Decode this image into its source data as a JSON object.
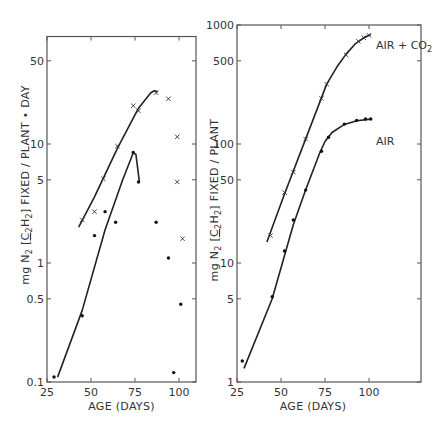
{
  "chart_data": [
    {
      "type": "scatter",
      "panel": "left",
      "title": "",
      "xlabel": "AGE (DAYS)",
      "ylabel": "mg N2 [C2H2] FIXED / PLANT • DAY",
      "yscale": "log",
      "xlim": [
        25,
        110
      ],
      "ylim": [
        0.1,
        80
      ],
      "xticks": [
        25,
        50,
        75,
        100
      ],
      "xtick_labels": [
        "25",
        "50",
        "75",
        "100"
      ],
      "yticks": [
        0.1,
        0.5,
        1,
        5,
        10,
        50
      ],
      "ytick_labels": [
        "0.1",
        "0.5",
        "1",
        "5",
        "10",
        "50"
      ],
      "grid": false,
      "series": [
        {
          "name": "AIR + CO2 (x)",
          "marker": "x",
          "points": [
            [
              45,
              2.3
            ],
            [
              52,
              2.7
            ],
            [
              57,
              5.1
            ],
            [
              65,
              9.6
            ],
            [
              74,
              21
            ],
            [
              77,
              19
            ],
            [
              87,
              27
            ],
            [
              94,
              24
            ],
            [
              99,
              11.5
            ],
            [
              99,
              4.8
            ],
            [
              102,
              1.6
            ]
          ],
          "fit_line": [
            [
              43,
              2.0
            ],
            [
              52,
              3.6
            ],
            [
              65,
              9.2
            ],
            [
              77,
              20
            ],
            [
              84,
              27
            ],
            [
              86,
              28
            ],
            [
              88,
              27.5
            ]
          ]
        },
        {
          "name": "AIR (filled)",
          "marker": "dot",
          "points": [
            [
              29,
              0.11
            ],
            [
              45,
              0.36
            ],
            [
              52,
              1.7
            ],
            [
              58,
              2.7
            ],
            [
              64,
              2.2
            ],
            [
              74,
              8.5
            ],
            [
              77,
              4.8
            ],
            [
              87,
              2.2
            ],
            [
              94,
              1.1
            ],
            [
              97,
              0.12
            ],
            [
              101,
              0.45
            ]
          ],
          "fit_line": [
            [
              31,
              0.11
            ],
            [
              45,
              0.4
            ],
            [
              58,
              1.9
            ],
            [
              68,
              5
            ],
            [
              74,
              8.4
            ],
            [
              75.5,
              8.2
            ],
            [
              77,
              5.5
            ],
            [
              77.5,
              4.8
            ]
          ]
        }
      ]
    },
    {
      "type": "line",
      "panel": "right",
      "title": "",
      "xlabel": "AGE (DAYS)",
      "ylabel": "mg N2 [C2H2] FIXED / PLANT",
      "yscale": "log",
      "xlim": [
        25,
        130
      ],
      "ylim": [
        1,
        1000
      ],
      "xticks": [
        25,
        50,
        75,
        100
      ],
      "xtick_labels": [
        "25",
        "50",
        "75",
        "100"
      ],
      "yticks": [
        1,
        5,
        10,
        50,
        100,
        500,
        1000
      ],
      "ytick_labels": [
        "1",
        "5",
        "10",
        "50",
        "100",
        "500",
        "1000"
      ],
      "grid": false,
      "series": [
        {
          "name": "AIR + CO2",
          "marker": "x",
          "points": [
            [
              44,
              17
            ],
            [
              52,
              39
            ],
            [
              57,
              58
            ],
            [
              64,
              110
            ],
            [
              73,
              242
            ],
            [
              76,
              318
            ],
            [
              87,
              560
            ],
            [
              94,
              730
            ],
            [
              97,
              780
            ],
            [
              100,
              820
            ]
          ],
          "fit_line": [
            [
              42,
              15
            ],
            [
              52,
              38
            ],
            [
              64,
              110
            ],
            [
              76,
              320
            ],
            [
              82,
              450
            ],
            [
              87,
              570
            ],
            [
              92,
              690
            ],
            [
              97,
              780
            ],
            [
              101,
              830
            ]
          ]
        },
        {
          "name": "AIR",
          "marker": "dot",
          "points": [
            [
              28,
              1.5
            ],
            [
              45,
              5.2
            ],
            [
              52,
              12.6
            ],
            [
              57,
              23
            ],
            [
              64,
              41
            ],
            [
              73,
              87
            ],
            [
              77,
              114
            ],
            [
              86,
              147
            ],
            [
              93,
              158
            ],
            [
              98,
              162
            ],
            [
              101,
              162
            ]
          ],
          "fit_line": [
            [
              29,
              1.3
            ],
            [
              45,
              5.0
            ],
            [
              57,
              21
            ],
            [
              64,
              41
            ],
            [
              72,
              84
            ],
            [
              75,
              105
            ],
            [
              79,
              125
            ],
            [
              86,
              146
            ],
            [
              93,
              157
            ],
            [
              101,
              162
            ]
          ]
        }
      ],
      "annotations": [
        {
          "text": "AIR + CO2",
          "x": 104,
          "y": 700
        },
        {
          "text": "AIR",
          "x": 104,
          "y": 120
        }
      ]
    }
  ],
  "labels": {
    "left_xlabel": "AGE (DAYS)",
    "right_xlabel": "AGE (DAYS)",
    "left_ylabel_prefix": "mg N",
    "left_ylabel_suffix": "FIXED / PLANT • DAY",
    "right_ylabel_prefix": "mg N",
    "right_ylabel_suffix": "FIXED / PLANT",
    "ylabel_sub": "2",
    "ylabel_bracket": "C2H2",
    "series_air_co2": "AIR + CO",
    "series_air_co2_sub": "2",
    "series_air": "AIR"
  }
}
